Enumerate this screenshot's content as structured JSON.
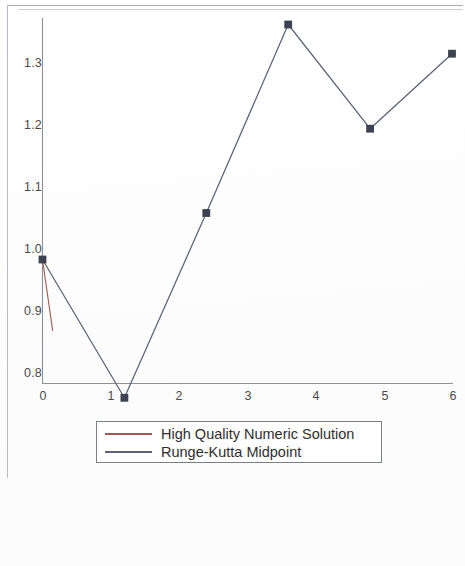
{
  "chart_data": {
    "type": "line",
    "title": "",
    "xlabel": "",
    "ylabel": "",
    "xlim": [
      0,
      6
    ],
    "ylim": [
      0.77,
      1.4
    ],
    "xticks": [
      "0",
      "1",
      "2",
      "3",
      "4",
      "5",
      "6"
    ],
    "yticks": [
      "0.8",
      "0.9",
      "1.0",
      "1.1",
      "1.2",
      "1.3"
    ],
    "grid": false,
    "legend_position": "below-plot",
    "markers": "square",
    "series": [
      {
        "name": "High Quality Numeric Solution",
        "color": "#9c5a52",
        "x": [
          0.0,
          0.15
        ],
        "values": [
          1.0,
          0.885
        ]
      },
      {
        "name": "Runge-Kutta Midpoint",
        "color": "#5b6277",
        "x": [
          0.0,
          1.2,
          2.4,
          3.6,
          4.8,
          6.0
        ],
        "values": [
          1.0,
          0.777,
          1.075,
          1.379,
          1.211,
          1.332
        ]
      }
    ]
  },
  "legend": {
    "entries": [
      {
        "label": "High Quality Numeric Solution",
        "color": "#9c5a52"
      },
      {
        "label": "Runge-Kutta Midpoint",
        "color": "#5b6277"
      }
    ]
  },
  "ruler": {
    "icon": "bookmark-icon",
    "icon_color": "#cfe6ee",
    "labels": [
      "0",
      "5",
      "10",
      "15",
      "20"
    ]
  }
}
